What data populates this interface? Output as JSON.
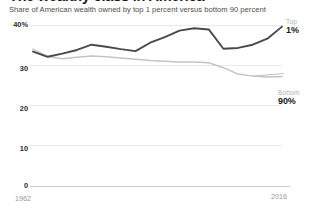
{
  "headline": "The wealthy class in America",
  "subtitle": "Share of American wealth owned by top 1 percent versus bottom 90 percent",
  "axis": {
    "y_labels": [
      "40%",
      "30",
      "20",
      "10",
      "0"
    ],
    "x_label_start": "1962",
    "x_label_end": "2016"
  },
  "annotations": {
    "top": {
      "kicker": "Top",
      "value": "1%"
    },
    "bottom": {
      "kicker": "Bottom",
      "value": "90%"
    }
  },
  "colors": {
    "top_series": "#4a4a4a",
    "bottom_series": "#c4c4c4",
    "grid": "#e9e9e9",
    "baseline": "#c9c9c9",
    "text": "#333333",
    "muted_text": "#9a9a9a"
  },
  "chart_data": {
    "type": "line",
    "title": "The wealthy class in America",
    "subtitle": "Share of American wealth owned by top 1 percent versus bottom 90 percent",
    "xlabel": "",
    "ylabel": "",
    "ylim": [
      0,
      40
    ],
    "xlim": [
      1962,
      2016
    ],
    "yticks": [
      0,
      10,
      20,
      30,
      40
    ],
    "ytick_labels": [
      "0",
      "10",
      "20",
      "30",
      "40%"
    ],
    "xticks": [
      1962,
      2016
    ],
    "xtick_labels": [
      "1962",
      "2016"
    ],
    "grid": true,
    "legend": "inline-right-annotations",
    "x": [
      1962,
      1965,
      1969,
      1972,
      1976,
      1979,
      1983,
      1986,
      1989,
      1992,
      1995,
      1998,
      2001,
      2004,
      2007,
      2010,
      2013,
      2016
    ],
    "series": [
      {
        "name": "Top 1%",
        "label": "Top 1%",
        "color": "#4a4a4a",
        "values": [
          33.4,
          32.1,
          32.9,
          33.8,
          35.1,
          34.6,
          34.0,
          33.5,
          35.6,
          37.0,
          38.6,
          39.2,
          38.9,
          34.1,
          34.3,
          35.1,
          36.6,
          39.6
        ]
      },
      {
        "name": "Bottom 90%",
        "label": "Bottom 90%",
        "color": "#c4c4c4",
        "values": [
          34.0,
          32.2,
          31.6,
          32.0,
          32.3,
          32.1,
          31.8,
          31.5,
          31.2,
          31.0,
          30.8,
          30.8,
          30.6,
          29.4,
          27.8,
          27.3,
          27.1,
          27.2
        ]
      }
    ]
  }
}
